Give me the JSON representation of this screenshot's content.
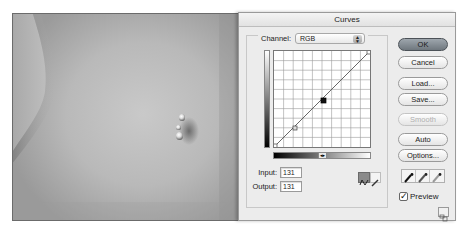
{
  "photo": {
    "description": "grayscale photo of a torso with navel piercing"
  },
  "dialog": {
    "title": "Curves",
    "channel": {
      "label": "Channel:",
      "value": "RGB"
    },
    "curve": {
      "grid_divisions": 10,
      "points": [
        {
          "input": 0,
          "output": 0
        },
        {
          "input": 77,
          "output": 49
        },
        {
          "input": 131,
          "output": 131,
          "selected": true
        },
        {
          "input": 255,
          "output": 255
        }
      ]
    },
    "input": {
      "label": "Input:",
      "value": "131"
    },
    "output": {
      "label": "Output:",
      "value": "131"
    },
    "buttons": {
      "ok": "OK",
      "cancel": "Cancel",
      "load": "Load...",
      "save": "Save...",
      "smooth": "Smooth",
      "auto": "Auto",
      "options": "Options..."
    },
    "eyedroppers": [
      "black-point",
      "gray-point",
      "white-point"
    ],
    "preview": {
      "label": "Preview",
      "checked": true
    },
    "tools": {
      "curve_tool": "curve-point-tool",
      "pencil_tool": "pencil-tool",
      "active": "curve-point-tool"
    }
  }
}
